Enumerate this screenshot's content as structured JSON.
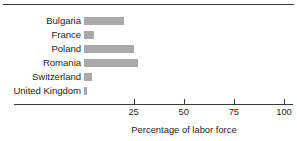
{
  "chart_data": {
    "type": "bar",
    "orientation": "horizontal",
    "title": "",
    "xlabel": "Percentage of labor force",
    "ylabel": "",
    "xlim": [
      0,
      100
    ],
    "xticks": [
      25,
      50,
      75,
      100
    ],
    "xtick_labels": [
      "25",
      "50",
      "75",
      "100"
    ],
    "grid": false,
    "legend": null,
    "bar_color": "#a9a9a9",
    "axis_color": "#3a3a3a",
    "categories": [
      "Bulgaria",
      "France",
      "Poland",
      "Romania",
      "Switzerland",
      "United Kingdom"
    ],
    "values": [
      20,
      5,
      25,
      27,
      4,
      1.5
    ],
    "bars": [
      {
        "label": "Bulgaria",
        "value": 20
      },
      {
        "label": "France",
        "value": 5
      },
      {
        "label": "Poland",
        "value": 25
      },
      {
        "label": "Romania",
        "value": 27
      },
      {
        "label": "Switzerland",
        "value": 4
      },
      {
        "label": "United Kingdom",
        "value": 1.5
      }
    ]
  }
}
